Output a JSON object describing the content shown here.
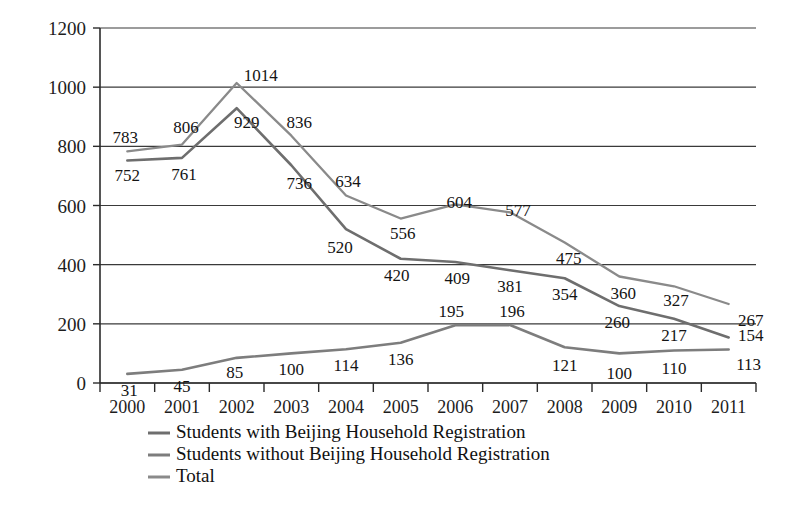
{
  "chart_data": {
    "type": "line",
    "title": "",
    "subtitle": "",
    "xlabel": "",
    "ylabel": "",
    "categories": [
      "2000",
      "2001",
      "2002",
      "2003",
      "2004",
      "2005",
      "2006",
      "2007",
      "2008",
      "2009",
      "2010",
      "2011"
    ],
    "ylim": [
      0,
      1200
    ],
    "yticks": [
      0,
      200,
      400,
      600,
      800,
      1000,
      1200
    ],
    "ytick_labels": [
      "0",
      "200",
      "400",
      "600",
      "800",
      "1000",
      "1200"
    ],
    "grid": true,
    "legend_position": "bottom-left",
    "series": [
      {
        "name": "Students with Beijing Household Registration",
        "color": "#6e6e6e",
        "values": [
          752,
          761,
          929,
          736,
          520,
          420,
          409,
          381,
          354,
          260,
          217,
          154
        ],
        "labels": [
          "752",
          "761",
          "929",
          "736",
          "520",
          "420",
          "409",
          "381",
          "354",
          "260",
          "217",
          "154"
        ],
        "label_offsets": [
          {
            "dx": 0,
            "dy": 20
          },
          {
            "dx": 2,
            "dy": 22
          },
          {
            "dx": 10,
            "dy": 20
          },
          {
            "dx": 8,
            "dy": 24
          },
          {
            "dx": -6,
            "dy": 24
          },
          {
            "dx": -4,
            "dy": 22
          },
          {
            "dx": 2,
            "dy": 22
          },
          {
            "dx": 0,
            "dy": 22
          },
          {
            "dx": 0,
            "dy": 22
          },
          {
            "dx": -2,
            "dy": 22
          },
          {
            "dx": 0,
            "dy": 22
          },
          {
            "dx": 22,
            "dy": 4
          }
        ]
      },
      {
        "name": "Students without Beijing Household Registration",
        "color": "#7d7d7d",
        "values": [
          31,
          45,
          85,
          100,
          114,
          136,
          195,
          196,
          121,
          100,
          110,
          113
        ],
        "labels": [
          "31",
          "45",
          "85",
          "100",
          "114",
          "136",
          "195",
          "196",
          "121",
          "100",
          "110",
          "113"
        ],
        "label_offsets": [
          {
            "dx": 2,
            "dy": 22
          },
          {
            "dx": 0,
            "dy": 22
          },
          {
            "dx": -2,
            "dy": 20
          },
          {
            "dx": 0,
            "dy": 22
          },
          {
            "dx": 0,
            "dy": 22
          },
          {
            "dx": 0,
            "dy": 22
          },
          {
            "dx": -4,
            "dy": -8
          },
          {
            "dx": 2,
            "dy": -8
          },
          {
            "dx": 0,
            "dy": 24
          },
          {
            "dx": 0,
            "dy": 26
          },
          {
            "dx": 0,
            "dy": 24
          },
          {
            "dx": 20,
            "dy": 20
          }
        ]
      },
      {
        "name": "Total",
        "color": "#8a8a8a",
        "values": [
          783,
          806,
          1014,
          836,
          634,
          556,
          604,
          577,
          475,
          360,
          327,
          267
        ],
        "labels": [
          "783",
          "806",
          "1014",
          "836",
          "634",
          "556",
          "604",
          "577",
          "475",
          "360",
          "327",
          "267"
        ],
        "label_offsets": [
          {
            "dx": -2,
            "dy": -8
          },
          {
            "dx": 4,
            "dy": -12
          },
          {
            "dx": 24,
            "dy": -2
          },
          {
            "dx": 8,
            "dy": -8
          },
          {
            "dx": 2,
            "dy": -8
          },
          {
            "dx": 2,
            "dy": 20
          },
          {
            "dx": 4,
            "dy": 4
          },
          {
            "dx": 8,
            "dy": 4
          },
          {
            "dx": 4,
            "dy": 22
          },
          {
            "dx": 4,
            "dy": 22
          },
          {
            "dx": 2,
            "dy": 20
          },
          {
            "dx": 22,
            "dy": 22
          }
        ]
      }
    ],
    "legend": [
      {
        "label": "Students with Beijing Household Registration",
        "color": "#6e6e6e"
      },
      {
        "label": "Students without Beijing Household Registration",
        "color": "#7d7d7d"
      },
      {
        "label": "Total",
        "color": "#8a8a8a"
      }
    ]
  }
}
